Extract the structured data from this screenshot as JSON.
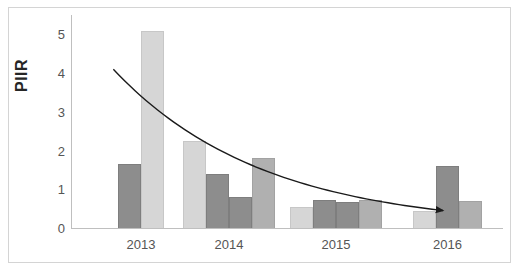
{
  "chart_data": {
    "type": "bar",
    "title": "",
    "subtitle": "",
    "xlabel": "",
    "ylabel": "PIIR",
    "categories": [
      "2013",
      "2014",
      "2015",
      "2016"
    ],
    "ylim": [
      0,
      5.5
    ],
    "yticks": [
      0,
      1,
      2,
      3,
      4,
      5
    ],
    "ytick_labels": [
      "0",
      "1",
      "2",
      "3",
      "4",
      "5"
    ],
    "grid": false,
    "legend": "none",
    "bars": [
      {
        "group": "2013",
        "index": 0,
        "value": 1.65,
        "shade": "dark"
      },
      {
        "group": "2013",
        "index": 1,
        "value": 5.1,
        "shade": "light"
      },
      {
        "group": "2014",
        "index": 0,
        "value": 2.25,
        "shade": "light"
      },
      {
        "group": "2014",
        "index": 1,
        "value": 1.4,
        "shade": "dark"
      },
      {
        "group": "2014",
        "index": 2,
        "value": 0.8,
        "shade": "dark"
      },
      {
        "group": "2014",
        "index": 3,
        "value": 1.8,
        "shade": "medium"
      },
      {
        "group": "2015",
        "index": 0,
        "value": 0.55,
        "shade": "light"
      },
      {
        "group": "2015",
        "index": 1,
        "value": 0.72,
        "shade": "dark"
      },
      {
        "group": "2015",
        "index": 2,
        "value": 0.68,
        "shade": "dark"
      },
      {
        "group": "2015",
        "index": 3,
        "value": 0.72,
        "shade": "medium"
      },
      {
        "group": "2016",
        "index": 0,
        "value": 0.45,
        "shade": "light"
      },
      {
        "group": "2016",
        "index": 1,
        "value": 1.6,
        "shade": "dark"
      },
      {
        "group": "2016",
        "index": 2,
        "value": 0.7,
        "shade": "medium"
      }
    ],
    "trendline": {
      "type": "exponential-decay",
      "direction": "decreasing",
      "arrow_head": true,
      "start_value": 4.1,
      "end_value": 0.45,
      "points": [
        {
          "x_frac": 0.098,
          "value": 4.1
        },
        {
          "x_frac": 0.2,
          "value": 3.2
        },
        {
          "x_frac": 0.3,
          "value": 2.55
        },
        {
          "x_frac": 0.4,
          "value": 2.05
        },
        {
          "x_frac": 0.5,
          "value": 1.65
        },
        {
          "x_frac": 0.6,
          "value": 1.32
        },
        {
          "x_frac": 0.7,
          "value": 1.05
        },
        {
          "x_frac": 0.8,
          "value": 0.82
        },
        {
          "x_frac": 0.9,
          "value": 0.62
        },
        {
          "x_frac": 0.865,
          "value": 0.45
        }
      ]
    },
    "colors": {
      "bar_dark": "#8d8d8d",
      "bar_light": "#d6d6d6",
      "bar_medium": "#b0b0b0",
      "axis": "#bfbfbf",
      "frame": "#d4d4d4",
      "tick_text": "#555555",
      "axis_title": "#262626",
      "trendline": "#1a1a1a",
      "background": "#ffffff"
    }
  }
}
